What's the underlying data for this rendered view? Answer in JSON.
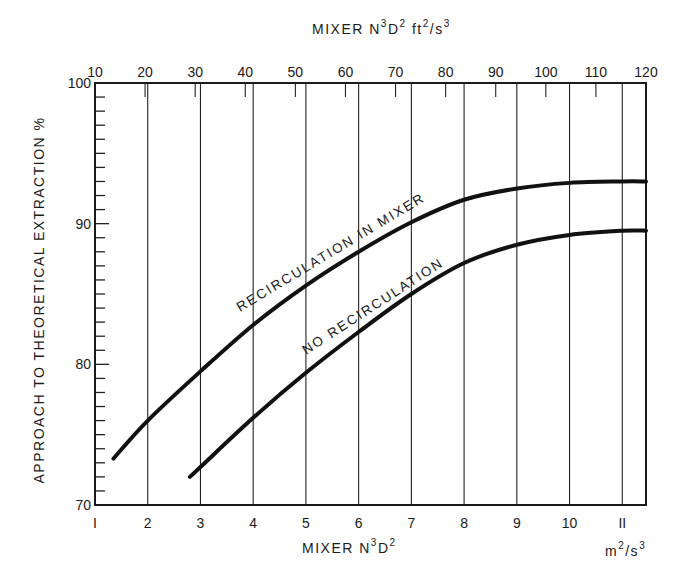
{
  "chart_data": {
    "type": "line",
    "title": "",
    "top_axis": {
      "label": "MIXER N³D² ft²/s³",
      "label_parts": [
        "MIXER N",
        "3",
        "D",
        "2",
        " ft",
        "2",
        "/s",
        "3"
      ],
      "ticks": [
        10,
        20,
        30,
        40,
        50,
        60,
        70,
        80,
        90,
        100,
        110,
        120
      ],
      "range": [
        10,
        120
      ]
    },
    "xlabel": "MIXER N³D²",
    "xlabel_parts": [
      "MIXER N",
      "3",
      "D",
      "2"
    ],
    "xunit": "m²/s³",
    "xunit_parts": [
      "m",
      "2",
      "/s",
      "3"
    ],
    "ylabel": "APPROACH TO THEORETICAL EXTRACTION %",
    "xticks": [
      1,
      2,
      3,
      4,
      5,
      6,
      7,
      8,
      9,
      10,
      11
    ],
    "yticks": [
      70,
      80,
      90,
      100
    ],
    "ylim": [
      70,
      100
    ],
    "xlim": [
      1,
      11.45
    ],
    "grid": "vertical lines at each integer m²/s³; short ticks on top axis every 10 ft²/s³; y-axis minor ticks every 1%",
    "legend": "none (curves labeled inline)",
    "series": [
      {
        "name": "RECIRCULATION IN MIXER",
        "x": [
          1.35,
          2,
          3,
          4,
          5,
          6,
          7,
          8,
          9,
          10,
          11,
          11.45
        ],
        "y": [
          73.3,
          76.0,
          79.5,
          82.8,
          85.6,
          88.0,
          90.1,
          91.7,
          92.5,
          92.9,
          93.0,
          93.0
        ]
      },
      {
        "name": "NO RECIRCULATION",
        "x": [
          2.8,
          3,
          4,
          5,
          6,
          7,
          8,
          9,
          10,
          11,
          11.45
        ],
        "y": [
          72.0,
          72.7,
          76.2,
          79.4,
          82.3,
          85.0,
          87.2,
          88.5,
          89.2,
          89.5,
          89.5
        ]
      }
    ]
  }
}
